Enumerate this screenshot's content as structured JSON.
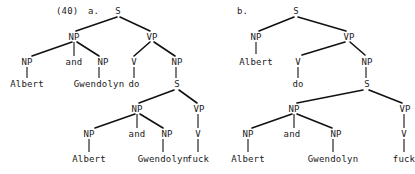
{
  "figure": {
    "example_number": "(40)",
    "tree_a_letter": "a.",
    "tree_b_letter": "b.",
    "ink_color": "#111111",
    "background_color": "#ffffff"
  },
  "tree_a": {
    "nodes": {
      "s_top": "S",
      "np_subject": "NP",
      "np_left_conjunct": "NP",
      "conjunction": "and",
      "np_right_conjunct": "NP",
      "vp_top": "VP",
      "v_top": "V",
      "np_object": "NP",
      "s_embedded": "S",
      "np_embedded_subject": "NP",
      "np_embedded_left": "NP",
      "conjunction_embedded": "and",
      "np_embedded_right": "NP",
      "vp_embedded": "VP",
      "v_embedded": "V"
    },
    "terminals": {
      "albert_upper": "Albert",
      "gwendolyn_upper": "Gwendolyn",
      "do": "do",
      "albert_lower": "Albert",
      "gwendolyn_lower": "Gwendolyn",
      "fuck": "fuck"
    }
  },
  "tree_b": {
    "nodes": {
      "s_top": "S",
      "np_subject": "NP",
      "vp_top": "VP",
      "v_top": "V",
      "np_object": "NP",
      "s_embedded": "S",
      "np_embedded_subject": "NP",
      "np_embedded_left": "NP",
      "conjunction_embedded": "and",
      "np_embedded_right": "NP",
      "vp_embedded": "VP",
      "v_embedded": "V"
    },
    "terminals": {
      "albert_upper": "Albert",
      "do": "do",
      "albert_lower": "Albert",
      "gwendolyn_lower": "Gwendolyn",
      "fuck": "fuck"
    }
  }
}
